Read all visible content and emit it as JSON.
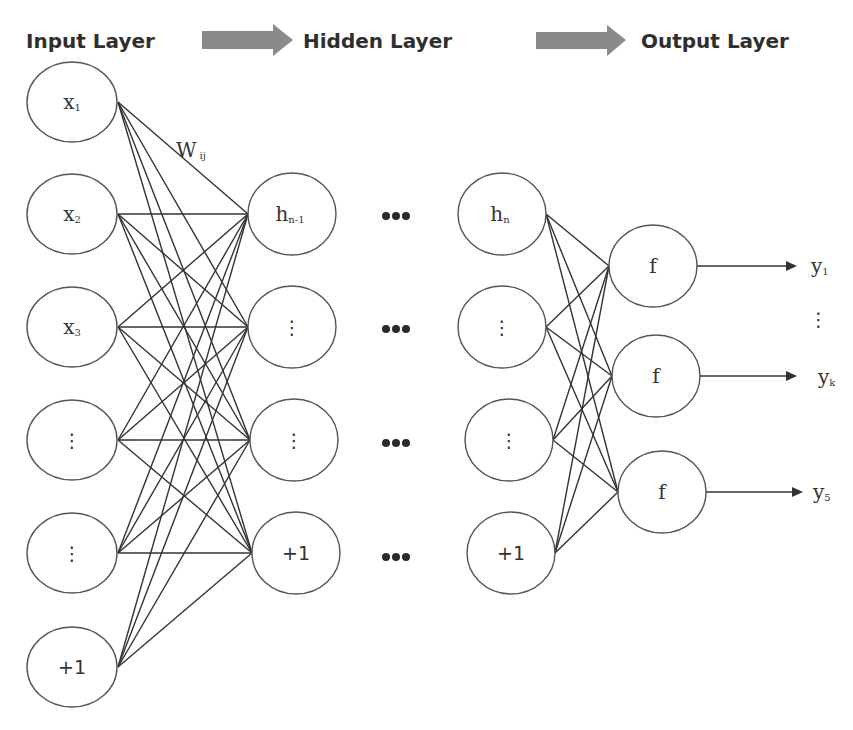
{
  "header": {
    "input_title": "Input Layer",
    "hidden_title": "Hidden Layer",
    "output_title": "Output Layer",
    "arrow_color": "#8a8a8a"
  },
  "weight_label": {
    "main": "W",
    "sub": "ij"
  },
  "input_layer": {
    "nodes": [
      {
        "main": "x",
        "sub": "1"
      },
      {
        "main": "x",
        "sub": "2"
      },
      {
        "main": "x",
        "sub": "3"
      },
      {
        "main": "⋮",
        "sub": ""
      },
      {
        "main": "⋮",
        "sub": ""
      },
      {
        "main": "+1",
        "sub": ""
      }
    ]
  },
  "hidden_layer_1": {
    "nodes": [
      {
        "main": "h",
        "sub": "n-1"
      },
      {
        "main": "⋮",
        "sub": ""
      },
      {
        "main": "⋮",
        "sub": ""
      },
      {
        "main": "+1",
        "sub": ""
      }
    ]
  },
  "ellipsis": "•••",
  "hidden_layer_n": {
    "nodes": [
      {
        "main": "h",
        "sub": "n"
      },
      {
        "main": "⋮",
        "sub": ""
      },
      {
        "main": "⋮",
        "sub": ""
      },
      {
        "main": "+1",
        "sub": ""
      }
    ]
  },
  "output_layer": {
    "nodes": [
      {
        "main": "f",
        "sub": ""
      },
      {
        "main": "f",
        "sub": ""
      },
      {
        "main": "f",
        "sub": ""
      }
    ]
  },
  "outputs": [
    {
      "main": "y",
      "sub": "1"
    },
    {
      "main": "⋮",
      "sub": ""
    },
    {
      "main": "y",
      "sub": "k"
    },
    {
      "main": "y",
      "sub": "5"
    }
  ]
}
